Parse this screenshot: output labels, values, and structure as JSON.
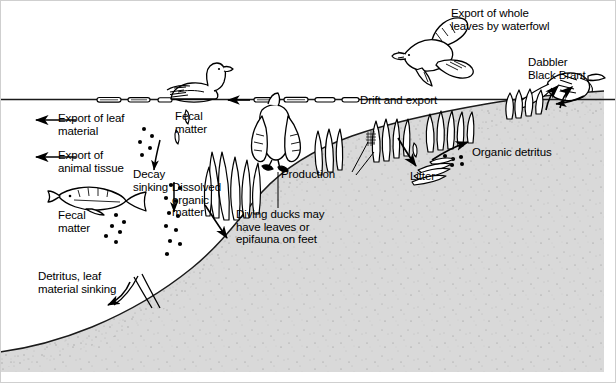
{
  "figure": {
    "border_color": "#c8c8c8",
    "water_color": "#ffffff",
    "sediment_color": "#d8d8d8",
    "sediment_speckle_color": "#8a8a8a",
    "line_color": "#000000"
  },
  "labels": {
    "export_leaf": "Export of leaf\nmaterial",
    "export_animal": "Export of\nanimal tissue",
    "fecal_matter_left": "Fecal\nmatter",
    "fecal_matter_top": "Fecal\nmatter",
    "decay_sinking": "Decay\nsinking",
    "dissolved_organic": "Dissolved\norganic\nmatter",
    "detritus_leaf_sinking": "Detritus, leaf\nmaterial sinking",
    "diving_ducks": "Diving ducks may\nhave leaves or\nepifauna on feet",
    "production": "Production",
    "drift_and_export": "Drift and export",
    "export_whole_leaves": "Export of whole\nleaves by waterfowl",
    "dabbler_black_brant": "Dabbler\nBlack Brant",
    "organic_detritus": "Organic detritus",
    "litter": "Litter"
  },
  "organisms": {
    "swimming_goose": "swimming-goose-icon",
    "flying_waterfowl": "flying-waterfowl-icon",
    "dabbling_brant": "dabbling-black-brant-icon",
    "diving_duck": "diving-duck-icon",
    "fish": "fish-icon",
    "eelgrass": "eelgrass-shoot-icon",
    "floating_leaf": "floating-leaf-icon",
    "leaf_litter_pile": "leaf-litter-pile-icon",
    "detritus_particle": "detritus-particle-icon"
  },
  "flows": [
    {
      "name": "export-leaf-material-arrow",
      "direction": "left"
    },
    {
      "name": "export-animal-tissue-arrow",
      "direction": "left"
    },
    {
      "name": "detritus-sinking-arrow",
      "direction": "down-left"
    },
    {
      "name": "decay-sinking-arrow",
      "direction": "down"
    },
    {
      "name": "fecal-matter-sinking-arrow",
      "direction": "down"
    },
    {
      "name": "dissolved-organic-matter-arrow",
      "direction": "down-right"
    },
    {
      "name": "surface-drift-arrow",
      "direction": "left"
    },
    {
      "name": "litter-deposition-arrow",
      "direction": "down-right"
    },
    {
      "name": "organic-detritus-resuspension-arrow",
      "direction": "up-right"
    },
    {
      "name": "brant-grazing-arrow",
      "direction": "up-left"
    }
  ]
}
